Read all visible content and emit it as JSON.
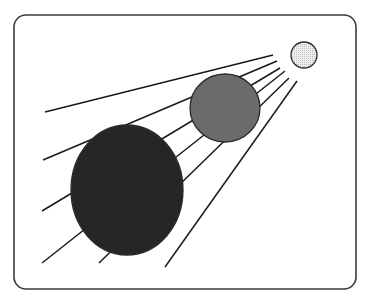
{
  "diagram": {
    "colors": {
      "background": "#ffffff",
      "frame_stroke": "#3a3a3a",
      "ray_stroke": "#1a1a1a",
      "sun_fill": "#e6e6e6",
      "medium_fill": "#6b6b6b",
      "large_fill": "#262626"
    },
    "frame": {
      "x": 14,
      "y": 15,
      "width": 342,
      "height": 274,
      "radius": 12
    },
    "rays": [
      {
        "x1": 273,
        "y1": 55,
        "x2": 45,
        "y2": 112
      },
      {
        "x1": 277,
        "y1": 61,
        "x2": 43,
        "y2": 160
      },
      {
        "x1": 280,
        "y1": 68,
        "x2": 42,
        "y2": 211
      },
      {
        "x1": 285,
        "y1": 71,
        "x2": 42,
        "y2": 263
      },
      {
        "x1": 289,
        "y1": 78,
        "x2": 99,
        "y2": 263
      },
      {
        "x1": 297,
        "y1": 81,
        "x2": 165,
        "y2": 267
      }
    ],
    "bodies": [
      {
        "name": "sun",
        "cx": 304,
        "cy": 55,
        "rx": 13,
        "ry": 13
      },
      {
        "name": "medium-sphere",
        "cx": 225,
        "cy": 108,
        "rx": 35,
        "ry": 34
      },
      {
        "name": "large-sphere",
        "cx": 127,
        "cy": 190,
        "rx": 56,
        "ry": 65
      }
    ]
  }
}
